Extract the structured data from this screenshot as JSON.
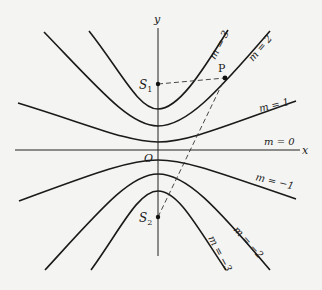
{
  "diagram": {
    "type": "family of hyperbolas",
    "axes": {
      "x_label": "x",
      "y_label": "y",
      "origin_label": "O"
    },
    "points": [
      {
        "id": "S1",
        "label": "S",
        "sub": "1"
      },
      {
        "id": "S2",
        "label": "S",
        "sub": "2"
      },
      {
        "id": "P",
        "label": "P"
      }
    ],
    "curves": [
      {
        "m": 3,
        "label": "m = 3"
      },
      {
        "m": 2,
        "label": "m = 2"
      },
      {
        "m": 1,
        "label": "m = 1"
      },
      {
        "m": 0,
        "label": "m = 0"
      },
      {
        "m": -1,
        "label": "m = −1"
      },
      {
        "m": -2,
        "label": "m = −2"
      },
      {
        "m": -3,
        "label": "m = −3"
      }
    ],
    "dashed_segments": [
      "S1–P",
      "S2–P"
    ],
    "colors": {
      "ink": "#1a1a1a",
      "paper": "#f4f4f2"
    }
  }
}
